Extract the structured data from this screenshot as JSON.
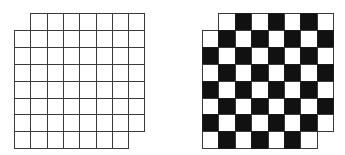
{
  "figure": {
    "rows": 8,
    "cols": 8,
    "removed_cells": [
      [
        0,
        0
      ],
      [
        7,
        7
      ]
    ],
    "colors": {
      "line": "#3a3a3a",
      "dark": "#111111",
      "light": "#ffffff"
    },
    "boards": [
      {
        "name": "plain-grid",
        "style": "outline",
        "left": 14,
        "top": 13,
        "cell_w": 16.3,
        "cell_h": 16.9
      },
      {
        "name": "checkered-grid",
        "style": "checker",
        "left": 202,
        "top": 13,
        "cell_w": 16.4,
        "cell_h": 16.9,
        "dark_when_sum_even": true
      }
    ]
  }
}
